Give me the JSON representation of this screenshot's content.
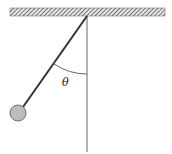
{
  "diagram": {
    "angle_label": "θ",
    "colors": {
      "line": "#333333",
      "ceiling": "#555555",
      "bob_fill": "#bdbdbd",
      "bob_stroke": "#555555"
    },
    "elements": {
      "ceiling": "hatched support bar",
      "vertical_reference": "vertical dashed-free line from pivot",
      "string": "pendulum string",
      "bob": "pendulum bob",
      "angle_arc": "angle between string and vertical"
    }
  }
}
